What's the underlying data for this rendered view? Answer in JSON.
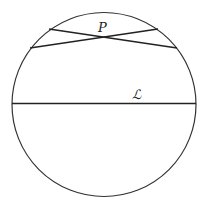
{
  "diagram": {
    "circle": {
      "cx": 104,
      "cy": 104.5,
      "r": 92,
      "stroke": "#333333"
    },
    "chords": [
      {
        "name": "chord-1",
        "x1": 49,
        "y1": 29,
        "x2": 177,
        "y2": 48
      },
      {
        "name": "chord-2",
        "x1": 30,
        "y1": 48,
        "x2": 158,
        "y2": 29
      },
      {
        "name": "line-L",
        "x1": 12,
        "y1": 103.5,
        "x2": 196,
        "y2": 103.5
      }
    ],
    "labels": {
      "point": "P",
      "line": "ℒ"
    }
  }
}
